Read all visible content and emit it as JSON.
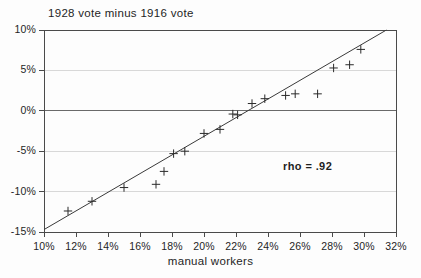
{
  "chart_data": {
    "type": "scatter",
    "title": "1928 vote minus 1916 vote",
    "xlabel": "manual workers",
    "ylabel": "",
    "xlim": [
      10,
      32
    ],
    "ylim": [
      -15,
      10
    ],
    "grid": true,
    "legend": null,
    "xticks": [
      "10%",
      "12%",
      "14%",
      "16%",
      "18%",
      "20%",
      "22%",
      "24%",
      "26%",
      "28%",
      "30%",
      "32%"
    ],
    "xtick_values": [
      10,
      12,
      14,
      16,
      18,
      20,
      22,
      24,
      26,
      28,
      30,
      32
    ],
    "yticks": [
      "10%",
      "5%",
      "0%",
      "-5%",
      "-10%",
      "-15%"
    ],
    "ytick_values": [
      10,
      5,
      0,
      -5,
      -10,
      -15
    ],
    "annotations": [
      {
        "text": "rho = .92",
        "x": 26.5,
        "y": -7.2
      }
    ],
    "points": [
      {
        "x": 11.5,
        "y": -12.4
      },
      {
        "x": 13.0,
        "y": -11.2
      },
      {
        "x": 15.0,
        "y": -9.5
      },
      {
        "x": 17.0,
        "y": -9.1
      },
      {
        "x": 17.5,
        "y": -7.5
      },
      {
        "x": 18.1,
        "y": -5.3
      },
      {
        "x": 18.8,
        "y": -5.0
      },
      {
        "x": 20.0,
        "y": -2.8
      },
      {
        "x": 21.0,
        "y": -2.3
      },
      {
        "x": 21.8,
        "y": -0.4
      },
      {
        "x": 22.1,
        "y": -0.5
      },
      {
        "x": 23.0,
        "y": 0.9
      },
      {
        "x": 23.8,
        "y": 1.5
      },
      {
        "x": 25.1,
        "y": 1.9
      },
      {
        "x": 25.7,
        "y": 2.1
      },
      {
        "x": 27.1,
        "y": 2.1
      },
      {
        "x": 28.1,
        "y": 5.3
      },
      {
        "x": 29.1,
        "y": 5.7
      },
      {
        "x": 29.8,
        "y": 7.6
      }
    ],
    "trendline": {
      "type": "linear-fit",
      "x_start": 10.0,
      "y_start": -14.7,
      "x_end": 31.4,
      "y_end": 10.0
    },
    "series_name": "states",
    "marker": "plus",
    "colors": {
      "background": "#fdfdfd",
      "axis": "#4a4a4a",
      "grid": "#d8d8d8",
      "zero_line": "#6a6a6a",
      "marker": "#2a2a2a",
      "trendline": "#3a3a3a",
      "text": "#1f1f1f"
    }
  }
}
